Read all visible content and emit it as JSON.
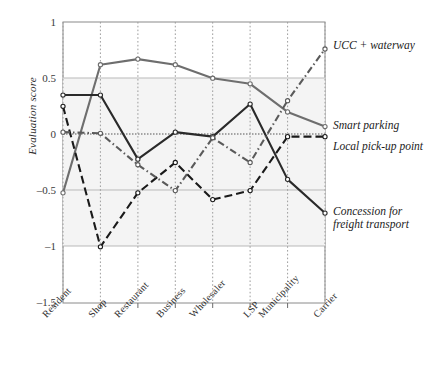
{
  "chart_data": {
    "type": "line",
    "title": "",
    "xlabel": "",
    "ylabel": "Evaluation score",
    "ylim": [
      -1.5,
      1
    ],
    "yticks": [
      "1",
      "0.5",
      "0",
      "–0.5",
      "–1",
      "–1.5"
    ],
    "ytick_values": [
      1,
      0.5,
      0,
      -0.5,
      -1,
      -1.5
    ],
    "grid": true,
    "legend_position": "right-inline-at-line-end",
    "categories": [
      "Resident",
      "Shop",
      "Restaurant",
      "Business",
      "Wholesaler",
      "LSP",
      "Municipality",
      "Carrier"
    ],
    "series": [
      {
        "name": "UCC + waterway",
        "style": "solid",
        "color": "#6e6e6e",
        "values": [
          -0.52,
          0.62,
          0.67,
          0.62,
          0.5,
          0.45,
          0.2,
          0.07
        ]
      },
      {
        "name": "Smart parking",
        "style": "solid",
        "color": "#2a2a2a",
        "values": [
          0.35,
          0.35,
          -0.22,
          0.02,
          -0.02,
          0.27,
          -0.4,
          -0.7
        ]
      },
      {
        "name": "Local pick-up point",
        "style": "dashed",
        "color": "#1a1a1a",
        "values": [
          0.25,
          -1.0,
          -0.52,
          -0.25,
          -0.58,
          -0.5,
          -0.02,
          -0.02
        ]
      },
      {
        "name": "Concession for freight transport",
        "style": "dash-dot",
        "color": "#5a5a5a",
        "values": [
          0.02,
          0.01,
          -0.27,
          -0.5,
          -0.03,
          -0.25,
          0.3,
          0.76
        ]
      }
    ],
    "legend_entries": [
      {
        "line1": "UCC + waterway",
        "line2": ""
      },
      {
        "line1": "Smart parking",
        "line2": ""
      },
      {
        "line1": "Local pick-up point",
        "line2": ""
      },
      {
        "line1": "Concession for",
        "line2": "freight transport"
      }
    ]
  }
}
